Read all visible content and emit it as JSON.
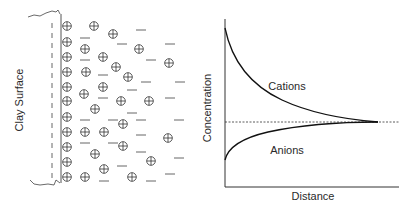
{
  "left_panel": {
    "surface_label": "Clay Surface",
    "cation_symbol": "plus-in-circle",
    "anion_symbol": "minus-dash",
    "wall_cations_y": [
      26,
      42,
      57,
      72,
      87,
      101,
      117,
      132,
      147,
      162,
      177
    ],
    "cations": [
      [
        94,
        26
      ],
      [
        113,
        34
      ],
      [
        139,
        49
      ],
      [
        85,
        49
      ],
      [
        103,
        57
      ],
      [
        169,
        63
      ],
      [
        86,
        72
      ],
      [
        116,
        67
      ],
      [
        128,
        77
      ],
      [
        103,
        87
      ],
      [
        84,
        94
      ],
      [
        121,
        101
      ],
      [
        149,
        101
      ],
      [
        95,
        109
      ],
      [
        123,
        124
      ],
      [
        85,
        132
      ],
      [
        104,
        132
      ],
      [
        168,
        138
      ],
      [
        123,
        146
      ],
      [
        95,
        154
      ],
      [
        151,
        161
      ],
      [
        104,
        169
      ],
      [
        85,
        177
      ],
      [
        132,
        177
      ]
    ],
    "anions": [
      [
        141,
        30
      ],
      [
        85,
        38
      ],
      [
        122,
        44
      ],
      [
        170,
        44
      ],
      [
        85,
        60
      ],
      [
        151,
        60
      ],
      [
        103,
        75
      ],
      [
        146,
        82
      ],
      [
        180,
        82
      ],
      [
        132,
        90
      ],
      [
        103,
        98
      ],
      [
        170,
        98
      ],
      [
        132,
        113
      ],
      [
        85,
        120
      ],
      [
        113,
        120
      ],
      [
        141,
        120
      ],
      [
        179,
        120
      ],
      [
        141,
        135
      ],
      [
        85,
        143
      ],
      [
        113,
        143
      ],
      [
        141,
        152
      ],
      [
        179,
        158
      ],
      [
        122,
        166
      ],
      [
        170,
        174
      ],
      [
        104,
        181
      ],
      [
        151,
        181
      ]
    ]
  },
  "right_panel": {
    "ylabel": "Concentration",
    "xlabel": "Distance",
    "cations_label": "Cations",
    "anions_label": "Anions"
  },
  "chart_data": {
    "type": "line",
    "title": "",
    "xlabel": "Distance",
    "ylabel": "Concentration",
    "grid": false,
    "legend": "inline labels",
    "x": [
      0,
      0.1,
      0.2,
      0.3,
      0.4,
      0.5,
      0.6,
      0.7,
      0.8,
      0.9,
      1.0
    ],
    "series": [
      {
        "name": "Cations",
        "values": [
          1.0,
          0.72,
          0.55,
          0.44,
          0.37,
          0.33,
          0.31,
          0.3,
          0.3,
          0.3,
          0.3
        ]
      },
      {
        "name": "Anions",
        "values": [
          0.0,
          0.15,
          0.21,
          0.25,
          0.27,
          0.285,
          0.293,
          0.298,
          0.3,
          0.3,
          0.3
        ]
      },
      {
        "name": "Equilibrium (dashed)",
        "values": [
          0.3,
          0.3,
          0.3,
          0.3,
          0.3,
          0.3,
          0.3,
          0.3,
          0.3,
          0.3,
          0.3
        ]
      }
    ],
    "annotations": [
      "Cations",
      "Anions"
    ],
    "ticks": "none"
  }
}
